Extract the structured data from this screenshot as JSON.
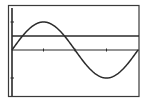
{
  "chart_data": {
    "type": "line",
    "title": "",
    "xlabel": "",
    "ylabel": "",
    "xlim": [
      0,
      6.2832
    ],
    "ylim": [
      -1.6,
      1.6
    ],
    "grid": false,
    "legend": null,
    "x_ticks": [
      1.5708,
      3.1416,
      4.7124
    ],
    "y_ticks": [
      -1,
      1
    ],
    "series": [
      {
        "name": "y = sin(x)",
        "function": "sin(x)",
        "x": [
          0,
          0.7854,
          1.5708,
          2.3562,
          3.1416,
          3.927,
          4.7124,
          5.4978,
          6.2832
        ],
        "values": [
          0,
          0.7071,
          1,
          0.7071,
          0,
          -0.7071,
          -1,
          -0.7071,
          0
        ]
      },
      {
        "name": "y = 0.5",
        "function": "0.5",
        "x": [
          0,
          6.2832
        ],
        "values": [
          0.5,
          0.5
        ]
      }
    ],
    "annotations": []
  },
  "colors": {
    "background": "#ffffff",
    "frame": "#3a3a3a",
    "axis": "#2a2a2a",
    "curve": "#2a2a2a",
    "hline": "#2a2a2a"
  }
}
